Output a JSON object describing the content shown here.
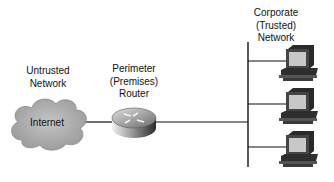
{
  "diagram": {
    "untrusted": {
      "line1": "Untrusted",
      "line2": "Network",
      "cloud_label": "Internet"
    },
    "router": {
      "line1": "Perimeter",
      "line2": "(Premises)",
      "line3": "Router"
    },
    "corporate": {
      "line1": "Corporate",
      "line2": "(Trusted)",
      "line3": "Network"
    },
    "workstations": [
      {
        "name": "workstation-1"
      },
      {
        "name": "workstation-2"
      },
      {
        "name": "workstation-3"
      }
    ],
    "colors": {
      "cloud": "#b4b4b4",
      "line": "#111111",
      "screen": "#c8c8c8",
      "monitor": "#444444"
    }
  }
}
